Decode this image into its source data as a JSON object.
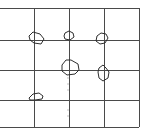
{
  "diagram": {
    "colors": {
      "background": "#ffffff",
      "grid_line": "#4a4a4a",
      "blob_outline": "#2e2e2e"
    },
    "grid": {
      "horizontal_lines_y": [
        8,
        40,
        70,
        100,
        127
      ],
      "vertical_lines_x": [
        34,
        69,
        104,
        139
      ],
      "x_start": 0,
      "x_end": 139,
      "y_start": 8,
      "y_end": 127
    },
    "blobs": [
      {
        "id": "blob-1",
        "points": "29,36 33,32 40,34 44,39 41,44 34,43 30,40"
      },
      {
        "id": "blob-2",
        "points": "65,33 69,31 73,33 74,37 70,40 65,39 64,36"
      },
      {
        "id": "blob-3",
        "points": "97,36 101,33 106,34 108,38 105,43 100,44 96,41"
      },
      {
        "id": "blob-4",
        "points": "62,65 66,60 71,60 78,64 79,70 75,74 67,75 62,71"
      },
      {
        "id": "blob-5",
        "points": "99,68 103,65 106,68 109,72 108,78 103,81 99,78 98,72"
      },
      {
        "id": "blob-6",
        "points": "29,98 33,94 39,93 43,96 42,99 35,100 30,100"
      }
    ]
  }
}
